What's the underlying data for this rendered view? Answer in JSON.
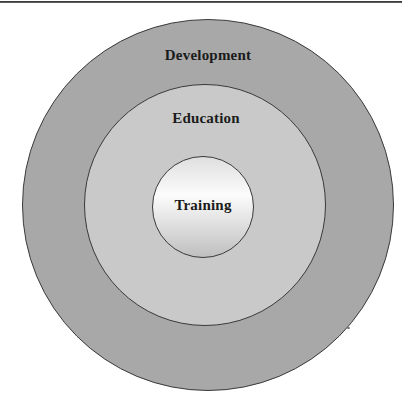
{
  "diagram": {
    "type": "concentric-circles",
    "rings": [
      {
        "name": "development",
        "label": "Development"
      },
      {
        "name": "education",
        "label": "Education"
      },
      {
        "name": "training",
        "label": "Training"
      }
    ]
  },
  "theme": {
    "outer_ring_fill": "#a8a8a8",
    "middle_ring_fill": "#c9c9c9",
    "inner_gradient_top": "#dfdfdf",
    "inner_gradient_mid": "#fcfcfc",
    "inner_gradient_bottom": "#bfbfbf",
    "circle_stroke": "#3a3a3a",
    "label_color": "#1b1b1b",
    "top_rule_color": "#3d3d3d",
    "page_background": "#ffffff"
  }
}
